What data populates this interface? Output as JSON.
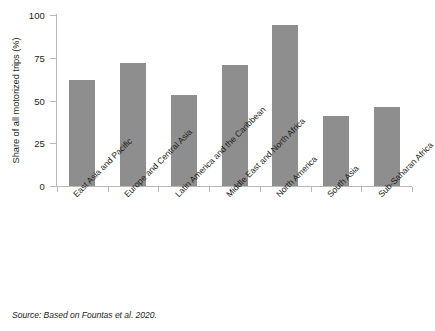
{
  "figure": {
    "source_note": "Source: Based on Fountas et al. 2020."
  },
  "chart_data": {
    "type": "bar",
    "title": "",
    "subtitle": "",
    "xlabel": "",
    "ylabel": "Share of all motorized trips (%)",
    "ylim": [
      0,
      100
    ],
    "yticks": [
      0,
      25,
      50,
      75,
      100
    ],
    "ytick_labels": [
      "0",
      "25",
      "50",
      "75",
      "100"
    ],
    "grid": false,
    "legend": false,
    "legend_position": "none",
    "bar_color": "#8e8e8e",
    "axis_color": "#b9b9b9",
    "categories": [
      "East Asia and Pacific",
      "Europe and Central Asia",
      "Latin America and the Caribbean",
      "Middle East and North Africa",
      "North America",
      "South Asia",
      "Sub-Saharan Africa"
    ],
    "values": [
      62,
      72,
      53,
      71,
      94,
      41,
      46
    ]
  }
}
